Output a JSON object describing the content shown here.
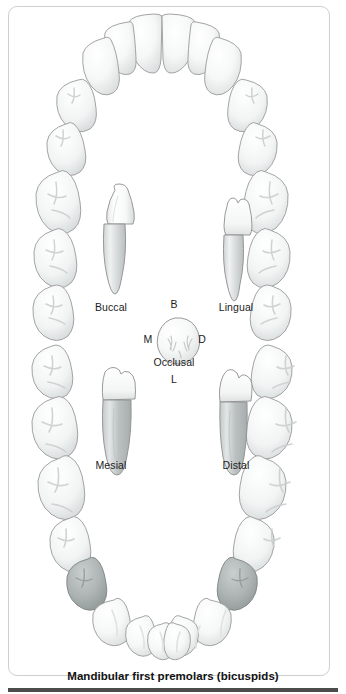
{
  "figure": {
    "caption": "Mandibular first premolars (bicuspids)",
    "credit": "© Cengage Learning 2013",
    "title": "Mandibular first premolars (bicuspids)"
  },
  "views": {
    "buccal": {
      "label": "Buccal"
    },
    "lingual": {
      "label": "Lingual"
    },
    "mesial": {
      "label": "Mesial"
    },
    "distal": {
      "label": "Distal"
    },
    "occlusal": {
      "label": "Occlusal",
      "surface_top": "B",
      "surface_left": "M",
      "surface_right": "D",
      "surface_bottom": "L"
    }
  },
  "orientation_keys": [
    {
      "key": "B",
      "meaning": "Buccal"
    },
    {
      "key": "M",
      "meaning": "Mesial"
    },
    {
      "key": "D",
      "meaning": "Distal"
    },
    {
      "key": "L",
      "meaning": "Lingual"
    }
  ],
  "arch": {
    "type": "mandibular",
    "highlighted_teeth": [
      "mandibular-right-first-premolar",
      "mandibular-left-first-premolar"
    ],
    "highlight_color": "#a3a9a9",
    "tooth_fill": "#fbfbfb",
    "tooth_outline": "#9a9a9a"
  },
  "colors": {
    "frame": "#cfcfcf",
    "rule": "#4c4c4c",
    "text": "#1c1c1c",
    "background": "#ffffff",
    "enamel_light": "#ffffff",
    "enamel_shadow": "#d8dada",
    "root_shadow": "#b6bbbb"
  }
}
